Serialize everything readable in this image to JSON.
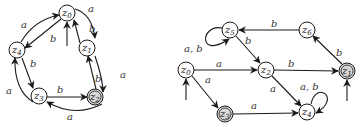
{
  "diagrams": [
    {
      "id": "left",
      "type": "finite-automaton",
      "nodes": [
        {
          "name": "z0",
          "base": "z",
          "sub": "0",
          "x": 67,
          "y": 13,
          "initial": true,
          "accepting": false
        },
        {
          "name": "z1",
          "base": "z",
          "sub": "1",
          "x": 87,
          "y": 48,
          "initial": false,
          "accepting": false
        },
        {
          "name": "z2",
          "base": "z",
          "sub": "2",
          "x": 95,
          "y": 97,
          "initial": false,
          "accepting": true
        },
        {
          "name": "z3",
          "base": "z",
          "sub": "3",
          "x": 39,
          "y": 96,
          "initial": false,
          "accepting": false
        },
        {
          "name": "z4",
          "base": "z",
          "sub": "4",
          "x": 17,
          "y": 50,
          "initial": false,
          "accepting": false
        }
      ],
      "edges": [
        {
          "from": "z0",
          "to": "z1",
          "label": "a"
        },
        {
          "from": "z1",
          "to": "z0",
          "label": "b"
        },
        {
          "from": "z1",
          "to": "z2",
          "label": "a"
        },
        {
          "from": "z2",
          "to": "z1",
          "label": "b"
        },
        {
          "from": "z2",
          "to": "z3",
          "label": "a"
        },
        {
          "from": "z3",
          "to": "z2",
          "label": "b"
        },
        {
          "from": "z3",
          "to": "z4",
          "label": "a"
        },
        {
          "from": "z4",
          "to": "z3",
          "label": "b"
        },
        {
          "from": "z4",
          "to": "z0",
          "label": "a"
        },
        {
          "from": "z0",
          "to": "z4",
          "label": "b"
        }
      ]
    },
    {
      "id": "right",
      "type": "finite-automaton",
      "nodes": [
        {
          "name": "z0",
          "base": "z",
          "sub": "0",
          "x": 186,
          "y": 70,
          "initial": true,
          "accepting": false
        },
        {
          "name": "z1",
          "base": "z",
          "sub": "1",
          "x": 347,
          "y": 71,
          "initial": true,
          "accepting": true
        },
        {
          "name": "z2",
          "base": "z",
          "sub": "2",
          "x": 266,
          "y": 70,
          "initial": false,
          "accepting": false
        },
        {
          "name": "z3",
          "base": "z",
          "sub": "3",
          "x": 225,
          "y": 114,
          "initial": false,
          "accepting": true
        },
        {
          "name": "z4",
          "base": "z",
          "sub": "4",
          "x": 307,
          "y": 112,
          "initial": false,
          "accepting": false
        },
        {
          "name": "z5",
          "base": "z",
          "sub": "5",
          "x": 230,
          "y": 30,
          "initial": false,
          "accepting": false
        },
        {
          "name": "z6",
          "base": "z",
          "sub": "6",
          "x": 307,
          "y": 30,
          "initial": false,
          "accepting": false
        }
      ],
      "edges": [
        {
          "from": "z0",
          "to": "z2",
          "label": "a"
        },
        {
          "from": "z0",
          "to": "z3",
          "label": "a"
        },
        {
          "from": "z3",
          "to": "z4",
          "label": "a"
        },
        {
          "from": "z2",
          "to": "z4",
          "label": "a"
        },
        {
          "from": "z2",
          "to": "z1",
          "label": "b"
        },
        {
          "from": "z1",
          "to": "z6",
          "label": "b"
        },
        {
          "from": "z6",
          "to": "z5",
          "label": "b"
        },
        {
          "from": "z5",
          "to": "z2",
          "label": "b"
        },
        {
          "from": "z5",
          "to": "z5",
          "label": "a, b"
        },
        {
          "from": "z4",
          "to": "z4",
          "label": "a, b"
        }
      ]
    }
  ],
  "labels": {
    "L": {
      "e01": "a",
      "e10": "b",
      "e12": "a",
      "e21": "b",
      "e23": "a",
      "e32": "b",
      "e34": "a",
      "e43": "b",
      "e40": "a",
      "e04": "b"
    },
    "R": {
      "e02": "a",
      "e03": "a",
      "e34": "a",
      "e24": "a",
      "e21": "b",
      "e16": "b",
      "e65": "b",
      "e52": "b",
      "loop5": "a, b",
      "loop4": "a, b"
    },
    "nodes": {
      "z": "z",
      "s0": "0",
      "s1": "1",
      "s2": "2",
      "s3": "3",
      "s4": "4",
      "s5": "5",
      "s6": "6"
    }
  },
  "colors": {
    "stroke": "#1a1a1a",
    "accepting_fill": "#d8d8d8",
    "background": "#ffffff"
  }
}
